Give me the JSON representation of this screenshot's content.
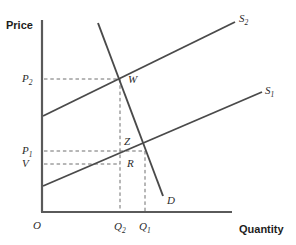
{
  "figure": {
    "kind": "supply-demand-diagram",
    "width": 296,
    "height": 245,
    "background": "#ffffff",
    "line_color": "#4a4a4a",
    "axis_color": "#5a5a5a",
    "dash_color": "#6e6e6e",
    "text_color": "#2b2b2b"
  },
  "axes": {
    "y_title": "Price",
    "x_title": "Quantity",
    "origin_label": "O",
    "y_axis": {
      "x": 42,
      "y_top": 20,
      "y_bottom": 212
    },
    "x_axis": {
      "y": 212,
      "x_left": 42,
      "x_right": 232
    }
  },
  "price_ticks": [
    {
      "id": "p2",
      "label": "P",
      "sub": "2",
      "y": 79
    },
    {
      "id": "p1",
      "label": "P",
      "sub": "1",
      "y": 151
    },
    {
      "id": "v",
      "label": "V",
      "sub": "",
      "y": 164
    }
  ],
  "quantity_ticks": [
    {
      "id": "q2",
      "label": "Q",
      "sub": "2",
      "x": 120
    },
    {
      "id": "q1",
      "label": "Q",
      "sub": "1",
      "x": 145
    }
  ],
  "curves": [
    {
      "id": "s2",
      "label": "S",
      "sub": "2",
      "kind": "supply",
      "x1": 43,
      "y1": 116,
      "x2": 235,
      "y2": 22,
      "label_x": 239,
      "label_y": 13
    },
    {
      "id": "s1",
      "label": "S",
      "sub": "1",
      "kind": "supply",
      "x1": 43,
      "y1": 186,
      "x2": 262,
      "y2": 92,
      "label_x": 265,
      "label_y": 85
    },
    {
      "id": "d",
      "label": "D",
      "sub": "",
      "kind": "demand",
      "x1": 98,
      "y1": 23,
      "x2": 163,
      "y2": 196,
      "label_x": 167,
      "label_y": 195
    }
  ],
  "points": [
    {
      "id": "w",
      "label": "W",
      "x": 120,
      "y": 80,
      "label_x": 128,
      "label_y": 80,
      "desc": "intersection of S2 and D"
    },
    {
      "id": "z",
      "label": "Z",
      "x": 120,
      "y": 151,
      "label_x": 124,
      "label_y": 142,
      "desc": "point on Q2 at price P1"
    },
    {
      "id": "r",
      "label": "R",
      "x": 120,
      "y": 164,
      "label_x": 127,
      "label_y": 164,
      "desc": "point on S1 at quantity Q2"
    }
  ],
  "dashed_guides": [
    {
      "id": "p2-to-w",
      "x1": 44,
      "y1": 79,
      "x2": 120,
      "y2": 79
    },
    {
      "id": "p1-to-e1",
      "x1": 44,
      "y1": 151,
      "x2": 145,
      "y2": 151
    },
    {
      "id": "v-to-r",
      "x1": 44,
      "y1": 164,
      "x2": 120,
      "y2": 164
    },
    {
      "id": "q2-vertical",
      "x1": 120,
      "y1": 79,
      "x2": 120,
      "y2": 212
    },
    {
      "id": "q1-vertical",
      "x1": 145,
      "y1": 151,
      "x2": 145,
      "y2": 212
    }
  ],
  "chart_data": {
    "type": "line",
    "title": "",
    "xlabel": "Quantity",
    "ylabel": "Price",
    "grid": false,
    "legend": "inline-curve-labels",
    "series": [
      {
        "name": "S1",
        "role": "original supply",
        "points": [
          [
            43,
            186
          ],
          [
            262,
            92
          ]
        ]
      },
      {
        "name": "S2",
        "role": "shifted supply",
        "points": [
          [
            43,
            116
          ],
          [
            235,
            22
          ]
        ]
      },
      {
        "name": "D",
        "role": "demand",
        "points": [
          [
            98,
            23
          ],
          [
            163,
            196
          ]
        ]
      }
    ],
    "annotations": [
      {
        "label": "W",
        "at": "S2 x D",
        "price": "P2",
        "quantity": "Q2"
      },
      {
        "label": "Z",
        "at": "Q2 at price P1",
        "price": "P1",
        "quantity": "Q2"
      },
      {
        "label": "R",
        "at": "S1 at quantity Q2",
        "price": "V",
        "quantity": "Q2"
      }
    ],
    "price_tick_labels": [
      "P2",
      "P1",
      "V"
    ],
    "quantity_tick_labels": [
      "Q2",
      "Q1"
    ]
  }
}
